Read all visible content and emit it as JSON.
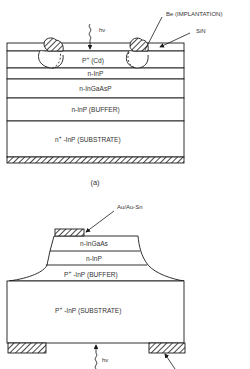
{
  "figure_a": {
    "caption": "(a)",
    "annotations": {
      "light": "hν",
      "implant": "Be (IMPLANTATION)",
      "passivation": "SiN"
    },
    "layers": [
      {
        "name": "p-region",
        "label": "P",
        "sup": "+",
        "suffix": " (Cd)"
      },
      {
        "name": "n-inp",
        "label": "n-InP"
      },
      {
        "name": "n-ingaasp",
        "label": "n-InGaAsP"
      },
      {
        "name": "n-inp-buffer",
        "label": "n-InP (BUFFER)"
      },
      {
        "name": "substrate",
        "label": "n",
        "sup": "+",
        "suffix": " -InP (SUBSTRATE)"
      }
    ]
  },
  "figure_b": {
    "annotations": {
      "contact": "Au/Au-Sn",
      "light": "hν"
    },
    "layers": [
      {
        "name": "n-ingaas",
        "label": "n-InGaAs"
      },
      {
        "name": "n-inp",
        "label": "n-InP"
      },
      {
        "name": "p-inp-buffer",
        "label": "P",
        "sup": "+",
        "suffix": " -InP (BUFFER)"
      },
      {
        "name": "p-inp-substrate",
        "label": "P",
        "sup": "+",
        "suffix": " -InP (SUBSTRATE)"
      }
    ]
  },
  "colors": {
    "line": "#1a1a1a",
    "text": "#333333",
    "background": "#ffffff"
  }
}
